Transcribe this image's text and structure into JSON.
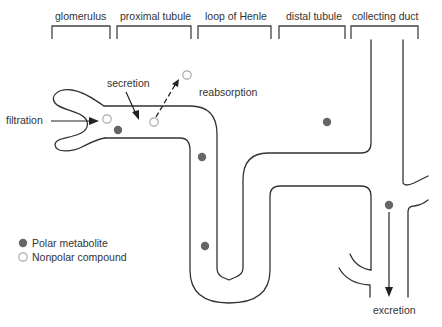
{
  "segments": [
    {
      "id": "glomerulus",
      "label": "glomerulus"
    },
    {
      "id": "proximal-tubule",
      "label": "proximal tubule"
    },
    {
      "id": "loop-of-henle",
      "label": "loop of Henle"
    },
    {
      "id": "distal-tubule",
      "label": "distal tubule"
    },
    {
      "id": "collecting-duct",
      "label": "collecting duct"
    }
  ],
  "processes": {
    "filtration": "filtration",
    "secretion": "secretion",
    "reabsorption": "reabsorption",
    "excretion": "excretion"
  },
  "legend": [
    {
      "kind": "polar",
      "label": "Polar metabolite",
      "color": "#666666",
      "filled": true
    },
    {
      "kind": "nonpolar",
      "label": "Nonpolar compound",
      "color": "#aaaaaa",
      "filled": false
    }
  ],
  "colors": {
    "polar": "#666666",
    "nonpolar_stroke": "#aaaaaa",
    "line": "#333333"
  }
}
